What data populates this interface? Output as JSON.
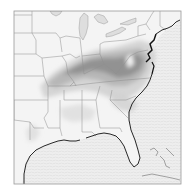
{
  "map": {
    "region": "Eastern United States",
    "type": "grayscale shaded field map",
    "frame": {
      "x": 14,
      "y": 11,
      "width": 167,
      "height": 173
    },
    "colors": {
      "background": "#ffffff",
      "land": "#f2f2f2",
      "ocean": "#e8e8e8",
      "shade_light": "#cfcfcf",
      "shade_mid": "#a8a8a8",
      "shade_dark": "#7a7a7a",
      "coast": "#111111",
      "border": "#8c8c8c",
      "frame": "#999999"
    },
    "labels": []
  }
}
